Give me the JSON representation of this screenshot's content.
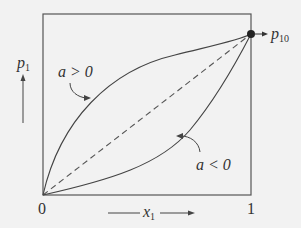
{
  "diagram": {
    "y_axis_label": {
      "var": "p",
      "sub": "1"
    },
    "x_axis_label": {
      "var": "x",
      "sub": "1"
    },
    "x_ticks": [
      "0",
      "1"
    ],
    "endpoint_label": {
      "var": "p",
      "sub": "10"
    },
    "curve_upper_label": "a > 0",
    "curve_lower_label": "a < 0",
    "colors": {
      "line": "#444444",
      "background": "#f2f2f2"
    }
  }
}
